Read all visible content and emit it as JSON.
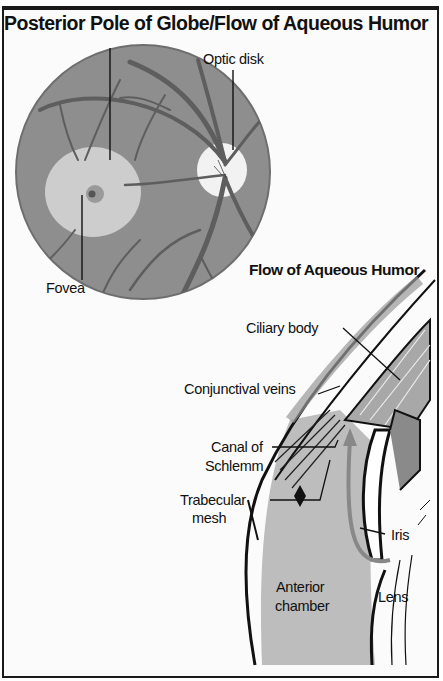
{
  "title": "Posterior Pole of Globe/Flow of Aqueous Humor",
  "panels": {
    "posterior_pole": {
      "labels": {
        "optic_disk": "Optic disk",
        "fovea": "Fovea"
      }
    },
    "aqueous_flow": {
      "subtitle": "Flow of Aqueous Humor",
      "labels": {
        "ciliary_body": "Ciliary body",
        "conjunctival_veins": "Conjunctival veins",
        "canal_of": "Canal of",
        "schlemm": "Schlemm",
        "trabecular": "Trabecular",
        "mesh": "mesh",
        "iris": "Iris",
        "anterior": "Anterior",
        "chamber": "chamber",
        "lens": "Lens"
      }
    }
  },
  "colors": {
    "fundus": "#8c8c8c",
    "macula": "#cfcfcf",
    "vessels": "#5a5a5a",
    "chamber": "#bdbdbd",
    "ink": "#111111"
  }
}
